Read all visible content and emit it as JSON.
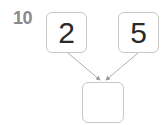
{
  "problem": {
    "number": "10",
    "top_left_value": "2",
    "top_right_value": "5",
    "bottom_value": ""
  },
  "colors": {
    "box_border": "#c8c8c8",
    "arrow": "#9a9a9a",
    "number_label": "#8a8a8a",
    "digit": "#2a2a2a"
  }
}
